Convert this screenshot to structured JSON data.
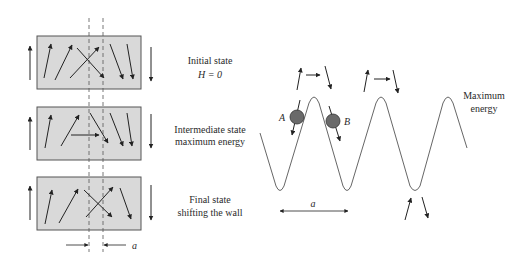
{
  "left_panel": {
    "states": [
      {
        "line1": "Initial state",
        "line2": "H = 0"
      },
      {
        "line1": "Intermediate state",
        "line2": "maximum energy"
      },
      {
        "line1": "Final state",
        "line2": "shifting the wall"
      }
    ],
    "wall_width_label": "a"
  },
  "right_panel": {
    "point_a_label": "A",
    "point_b_label": "B",
    "max_energy_line1": "Maximum",
    "max_energy_line2": "energy",
    "period_label": "a"
  },
  "colors": {
    "box_fill": "#d9d9d9",
    "box_stroke": "#555555",
    "arrow": "#222222",
    "ball_fill": "#6a6a6a",
    "curve": "#555555"
  }
}
